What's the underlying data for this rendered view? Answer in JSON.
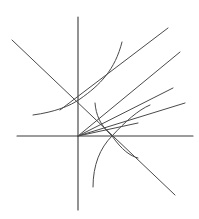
{
  "diagram": {
    "title": "",
    "stroke_color": "#4a4a4a",
    "axis_color": "#3a3a3a",
    "background": "#ffffff",
    "axes": {
      "origin": [
        78,
        136
      ],
      "x_axis": {
        "from": [
          17,
          136
        ],
        "to": [
          195,
          136
        ],
        "arrow": true
      },
      "y_axis": {
        "from": [
          78,
          210
        ],
        "to": [
          78,
          15
        ],
        "arrow": true
      }
    },
    "curves": [
      {
        "name": "decreasing-line",
        "kind": "line",
        "d": "M12,40 L175,195"
      },
      {
        "name": "exponential-curve",
        "kind": "curve",
        "d": "M33,115 C55,112 70,106 80,99 C100,85 115,70 122,42"
      },
      {
        "name": "offset-line",
        "kind": "line",
        "d": "M60,110 L168,28"
      },
      {
        "name": "origin-line-steep",
        "kind": "line",
        "d": "M78,136 L180,52"
      },
      {
        "name": "origin-line-medium",
        "kind": "line",
        "d": "M78,136 L173,88"
      },
      {
        "name": "origin-line-shallow",
        "kind": "line",
        "d": "M78,136 L185,103"
      },
      {
        "name": "inverse-curve",
        "kind": "curve",
        "d": "M95,103 C96,115 100,125 112,136 C122,150 130,156 138,158"
      },
      {
        "name": "origin-short-line",
        "kind": "line",
        "d": "M78,136 L138,123"
      },
      {
        "name": "logarithmic-curve",
        "kind": "curve",
        "d": "M93,187 C93,165 100,148 112,136 C125,122 138,110 150,105"
      }
    ]
  }
}
